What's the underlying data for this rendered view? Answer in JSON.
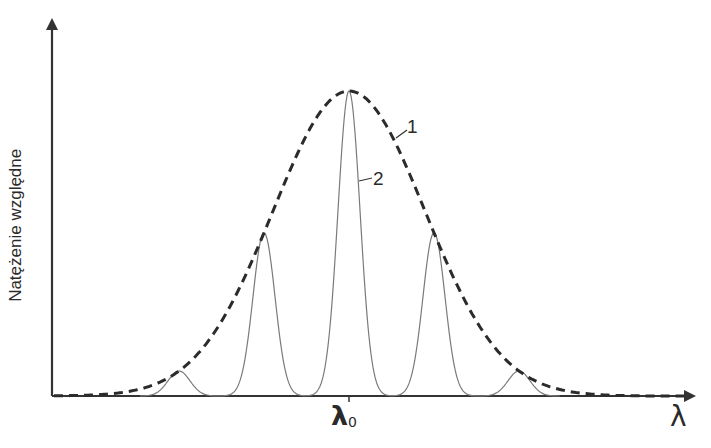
{
  "chart_data": {
    "type": "line",
    "title": "",
    "ylabel": "Natężenie względne",
    "xlabel": "λ",
    "x_tick_labels": [
      {
        "position": 0,
        "label": "λ",
        "subscript": "0"
      }
    ],
    "grid": false,
    "legend": null,
    "annotations": [
      {
        "text": "1",
        "target": "dashed envelope curve"
      },
      {
        "text": "2",
        "target": "solid peaked curve"
      }
    ],
    "x_range_relative_to_lambda0": [
      -4.0,
      4.0
    ],
    "ylim": [
      0,
      1
    ],
    "series": [
      {
        "name": "1",
        "style": "dashed",
        "description": "Gaussian envelope centered at λ0",
        "x": [
          -4.0,
          -3.0,
          -2.0,
          -1.0,
          0.0,
          1.0,
          2.0,
          3.0,
          4.0
        ],
        "values": [
          0.01,
          0.08,
          0.33,
          0.61,
          1.0,
          0.61,
          0.33,
          0.08,
          0.01
        ]
      },
      {
        "name": "2",
        "style": "solid",
        "description": "Narrow peaks modulated by envelope",
        "peaks_x": [
          -2.0,
          -1.0,
          0.0,
          1.0,
          2.0
        ],
        "peaks_values": [
          0.09,
          0.53,
          1.0,
          0.53,
          0.09
        ]
      }
    ]
  },
  "labels": {
    "ylabel": "Natężenie względne",
    "xlabel": "λ",
    "tick_main": "λ",
    "tick_sub": "0",
    "curve1": "1",
    "curve2": "2"
  },
  "colors": {
    "axis": "#333333",
    "envelope": "#2b2b2b",
    "peaks": "#7a7a7a"
  }
}
